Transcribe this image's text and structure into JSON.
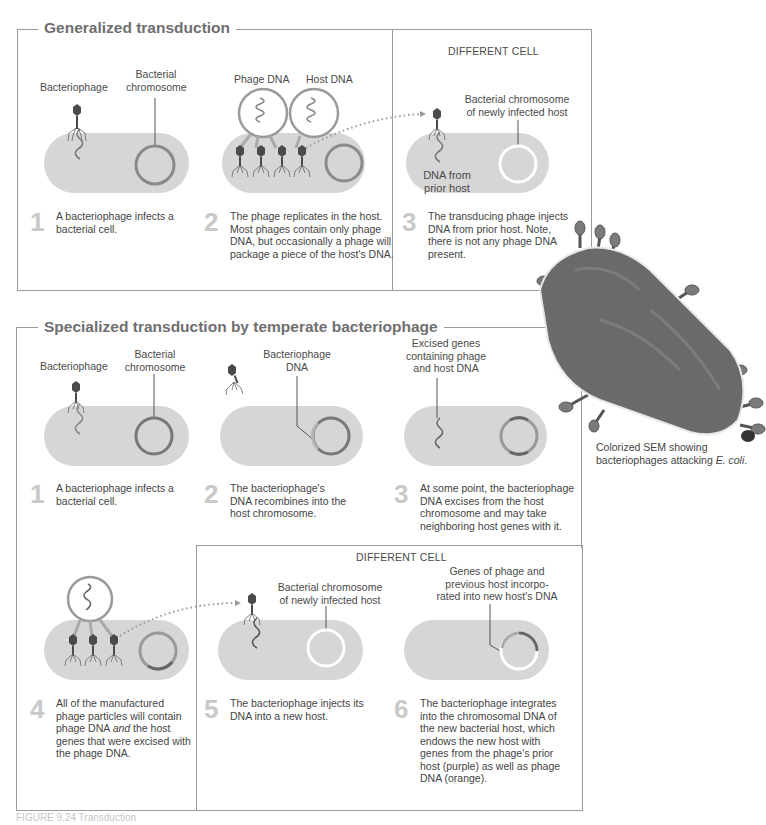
{
  "generalized": {
    "title": "Generalized transduction",
    "different_cell": "DIFFERENT CELL",
    "labels": {
      "bacteriophage": "Bacteriophage",
      "bacterial_chromosome_1": "Bacterial",
      "bacterial_chromosome_2": "chromosome",
      "phage_dna": "Phage DNA",
      "host_dna": "Host DNA",
      "newly_infected_1": "Bacterial chromosome",
      "newly_infected_2": "of newly infected host",
      "dna_prior_1": "DNA from",
      "dna_prior_2": "prior host"
    },
    "steps": [
      {
        "num": "1",
        "lines": [
          "A bacteriophage infects a",
          "bacterial cell."
        ]
      },
      {
        "num": "2",
        "lines": [
          "The phage replicates in the host.",
          "Most phages contain only phage",
          "DNA, but occasionally a phage will",
          "package a piece of the host's DNA."
        ]
      },
      {
        "num": "3",
        "lines": [
          "The transducing phage injects",
          "DNA from prior host. Note,",
          "there is not any phage DNA",
          "present."
        ]
      }
    ]
  },
  "specialized": {
    "title": "Specialized transduction by temperate bacteriophage",
    "different_cell": "DIFFERENT CELL",
    "labels": {
      "bacteriophage": "Bacteriophage",
      "bacterial_chromosome_1": "Bacterial",
      "bacterial_chromosome_2": "chromosome",
      "bacteriophage_dna_1": "Bacteriophage",
      "bacteriophage_dna_2": "DNA",
      "excised_1": "Excised genes",
      "excised_2": "containing phage",
      "excised_3": "and host DNA",
      "newly_infected_1": "Bacterial chromosome",
      "newly_infected_2": "of newly infected host",
      "genes_1": "Genes of phage and",
      "genes_2": "previous host incorpo-",
      "genes_3": "rated into new host's DNA"
    },
    "steps": [
      {
        "num": "1",
        "lines": [
          "A bacteriophage infects a",
          "bacterial cell."
        ]
      },
      {
        "num": "2",
        "lines": [
          "The bacteriophage's",
          "DNA recombines into the",
          "host chromosome."
        ]
      },
      {
        "num": "3",
        "lines": [
          "At some point, the bacteriophage",
          "DNA excises from the host",
          "chromosome and may take",
          "neighboring host genes with it."
        ]
      },
      {
        "num": "4",
        "lines": [
          "All of the manufactured",
          "phage particles will contain",
          "phage DNA and the host",
          "genes that were excised with",
          "the phage DNA."
        ]
      },
      {
        "num": "5",
        "lines": [
          "The bacteriophage injects its",
          "DNA into a new host."
        ]
      },
      {
        "num": "6",
        "lines": [
          "The bacteriophage integrates",
          "into the chromosomal DNA of",
          "the new bacterial host, which",
          "endows the new host with",
          "genes from the phage's prior",
          "host (purple) as well as phage",
          "DNA (orange)."
        ]
      }
    ]
  },
  "sem": {
    "caption_line1": "Colorized SEM showing",
    "caption_line2_prefix": "bacteriophages attacking ",
    "caption_italic": "E. coli",
    "caption_suffix": "."
  },
  "figure_caption": "FIGURE 9.24 Transduction",
  "colors": {
    "cell_fill": "#d6d6d6",
    "chromosome": "#8a8a8a",
    "phage": "#4a4a4a",
    "border": "#9a9a9a",
    "step_number": "#c9c9c9"
  }
}
